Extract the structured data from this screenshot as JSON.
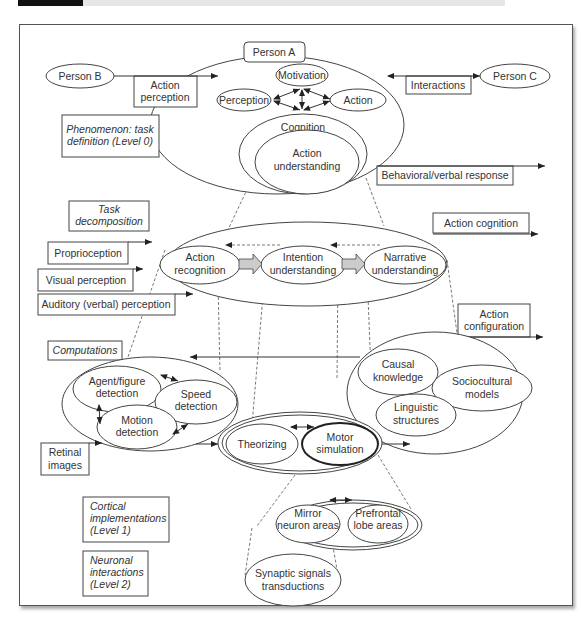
{
  "diagram": {
    "person_a": "Person A",
    "person_b": "Person B",
    "person_c": "Person C",
    "action_perception": [
      "Action",
      "perception"
    ],
    "interactions": "Interactions",
    "motivation": "Motivation",
    "perception": "Perception",
    "action": "Action",
    "cognition": "Cognition",
    "action_understanding": [
      "Action",
      "understanding"
    ],
    "phenomenon": [
      "Phenomenon: task",
      "definition (Level 0)"
    ],
    "behavioral_response": "Behavioral/verbal response",
    "task_decomposition": [
      "Task",
      "decomposition"
    ],
    "action_cognition": "Action cognition",
    "proprioception": "Proprioception",
    "visual_perception": "Visual perception",
    "auditory_perception": "Auditory (verbal) perception",
    "action_recognition": [
      "Action",
      "recognition"
    ],
    "intention_understanding": [
      "Intention",
      "understanding"
    ],
    "narrative_understanding": [
      "Narrative",
      "understanding"
    ],
    "action_configuration": [
      "Action",
      "configuration"
    ],
    "computations": "Computations",
    "agent_figure_detection": [
      "Agent/figure",
      "detection"
    ],
    "speed_detection": [
      "Speed",
      "detection"
    ],
    "motion_detection": [
      "Motion",
      "detection"
    ],
    "retinal_images": [
      "Retinal",
      "images"
    ],
    "causal_knowledge": [
      "Causal",
      "knowledge"
    ],
    "sociocultural_models": [
      "Sociocultural",
      "models"
    ],
    "linguistic_structures": [
      "Linguistic",
      "structures"
    ],
    "theorizing": "Theorizing",
    "motor_simulation": [
      "Motor",
      "simulation"
    ],
    "cortical_implementations": [
      "Cortical",
      "implementations",
      "(Level 1)"
    ],
    "neuronal_interactions": [
      "Neuronal",
      "interactions",
      "(Level 2)"
    ],
    "mirror_neuron_areas": [
      "Mirror",
      "neuron areas"
    ],
    "prefrontal_lobe_areas": [
      "Prefrontal",
      "lobe areas"
    ],
    "synaptic_signals": [
      "Synaptic signals",
      "transductions"
    ]
  },
  "colors": {
    "stroke": "#444444",
    "block_arrow_fill": "#cccccc",
    "header_bar": "#111111"
  }
}
